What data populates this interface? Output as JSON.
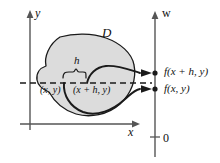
{
  "figure": {
    "background_color": "#ffffff",
    "stroke_color": "#1a1a1a",
    "axis_color": "#555555",
    "region_fill_color": "#dcdcdc"
  },
  "axes": {
    "y_axis_label": "y",
    "x_axis_label": "x",
    "w_axis_label": "w",
    "origin_label": "0"
  },
  "region": {
    "label": "D"
  },
  "measure": {
    "brace_label": "h"
  },
  "points": {
    "base_point_label": "(x, y)",
    "shifted_point_label": "(x + h, y)"
  },
  "values": {
    "shifted_value_label": "f(x + h, y)",
    "base_value_label": "f(x, y)"
  }
}
